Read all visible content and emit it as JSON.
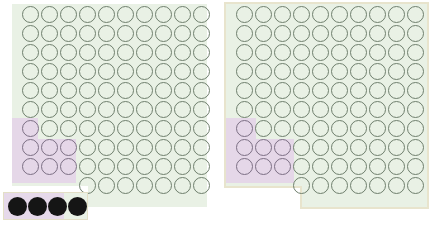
{
  "scene": {
    "title": "Two grid panels with selection overlay",
    "background_color": "#ffffff"
  },
  "palette": {
    "board_green": "#e9f1e5",
    "selection_purple": "#e5d7e8",
    "ring_stroke_green": "#6f7f6d",
    "ring_stroke_purple": "#7c6f84",
    "frame_cream": "#e8e4cd",
    "dot_black": "#151515",
    "page_white": "#ffffff"
  },
  "grid": {
    "columns": 10,
    "full_rows": 9,
    "tail_row": {
      "count": 7,
      "start_column": 4,
      "label": "indented bottom row"
    },
    "total_circles": 97,
    "cell_pitch_px": 19,
    "circle_diameter_px": 17
  },
  "selection": {
    "shape": "staircase",
    "rows": [
      {
        "row": 7,
        "columns": 1
      },
      {
        "row": 8,
        "columns": 3
      },
      {
        "row": 9,
        "columns": 3
      }
    ],
    "selected_circle_count": 7
  },
  "panels": [
    {
      "id": "left",
      "name": "left-panel",
      "has_frame": false,
      "board_left_px": 20,
      "board_top_px": 4,
      "strip": {
        "name": "left-dot-strip",
        "dot_count": 4,
        "has_border": true,
        "purple_fraction": 0.72,
        "green_tail": true
      }
    },
    {
      "id": "right",
      "name": "right-panel",
      "has_frame": true,
      "board_left_px": 12,
      "board_top_px": 4,
      "strip": {
        "name": "right-dot-strip",
        "dot_count": 4,
        "has_border": false,
        "purple_fraction": 1.0,
        "green_tail": false
      }
    }
  ],
  "legend": {
    "dot_symbol": "filled-circle",
    "ring_symbol": "hollow-circle"
  }
}
